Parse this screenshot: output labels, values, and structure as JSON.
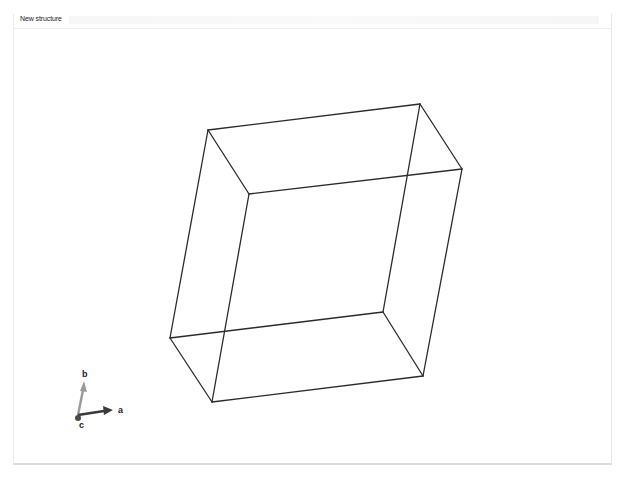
{
  "window": {
    "tab_title": "New structure"
  },
  "viewport": {
    "background": "#ffffff",
    "line_color": "#2b2b2b",
    "unit_cell": {
      "vertices": {
        "back_top_left": [
          208,
          130
        ],
        "back_top_right": [
          420,
          104
        ],
        "front_top_right": [
          462,
          169
        ],
        "front_top_left": [
          249,
          194
        ],
        "back_bottom_left": [
          170,
          338
        ],
        "back_bottom_right": [
          383,
          312
        ],
        "front_bottom_right": [
          423,
          376
        ],
        "front_bottom_left": [
          212,
          402
        ]
      }
    },
    "axes_indicator": {
      "a_label": "a",
      "b_label": "b",
      "c_label": "c",
      "a_color": "#3a3a3a",
      "b_color": "#9a9a9a",
      "c_color": "#4a4a4a"
    }
  }
}
